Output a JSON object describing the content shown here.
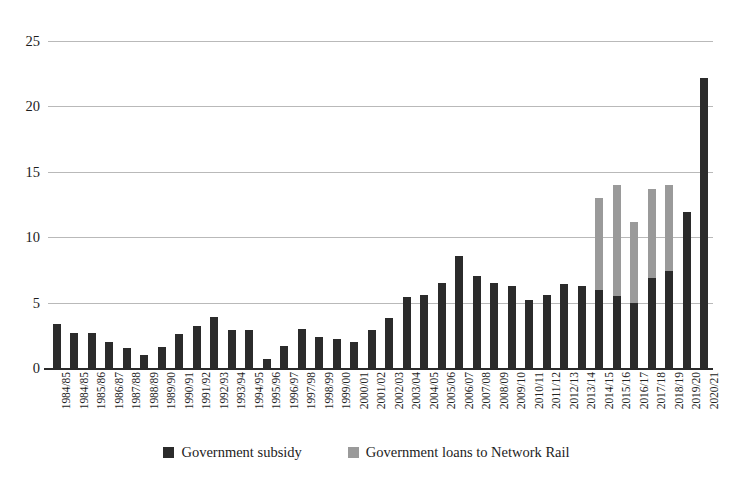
{
  "chart_data": {
    "type": "bar",
    "stacked": true,
    "title": "",
    "subtitle": "",
    "xlabel": "",
    "ylabel": "",
    "ylim": [
      0,
      25
    ],
    "yticks": [
      0,
      5,
      10,
      15,
      20,
      25
    ],
    "grid": true,
    "legend_position": "bottom",
    "colors": {
      "subsidy": "#2b2b2b",
      "loans": "#9a9a9a",
      "gridline": "#b9b9b9",
      "axis": "#2a2a2a",
      "text": "#1c1c1c",
      "background": "#ffffff"
    },
    "categories": [
      "1984/85",
      "1984/85",
      "1985/86",
      "1986/87",
      "1987/88",
      "1988/89",
      "1989/90",
      "1990/91",
      "1991/92",
      "1992/93",
      "1993/94",
      "1994/95",
      "1995/96",
      "1996/97",
      "1997/98",
      "1998/99",
      "1999/00",
      "2000/01",
      "2001/02",
      "2002/03",
      "2003/04",
      "2004/05",
      "2005/06",
      "2006/07",
      "2007/08",
      "2008/09",
      "2009/10",
      "2010/11",
      "2011/12",
      "2012/13",
      "2013/14",
      "2014/15",
      "2015/16",
      "2016/17",
      "2017/18",
      "2018/19",
      "2019/20",
      "2020/21"
    ],
    "series": [
      {
        "name": "Government subsidy",
        "key": "subsidy",
        "values": [
          3.4,
          2.7,
          2.7,
          2.0,
          1.5,
          1.0,
          1.6,
          2.6,
          3.2,
          3.9,
          2.9,
          2.9,
          0.7,
          1.7,
          3.0,
          2.4,
          2.2,
          2.0,
          2.9,
          3.8,
          5.4,
          5.6,
          6.5,
          8.6,
          7.0,
          6.5,
          6.3,
          5.2,
          5.6,
          6.4,
          6.3,
          6.0,
          5.5,
          5.0,
          6.9,
          7.4,
          11.9,
          22.2
        ]
      },
      {
        "name": "Government loans to Network Rail",
        "key": "loans",
        "values": [
          0,
          0,
          0,
          0,
          0,
          0,
          0,
          0,
          0,
          0,
          0,
          0,
          0,
          0,
          0,
          0,
          0,
          0,
          0,
          0,
          0,
          0,
          0,
          0,
          0,
          0,
          0,
          0,
          0,
          0,
          0,
          7.0,
          8.5,
          6.2,
          6.8,
          6.6,
          0,
          0
        ]
      }
    ]
  },
  "legend": {
    "items": [
      {
        "label": "Government subsidy",
        "key": "subsidy"
      },
      {
        "label": "Government loans to Network Rail",
        "key": "loans"
      }
    ]
  }
}
